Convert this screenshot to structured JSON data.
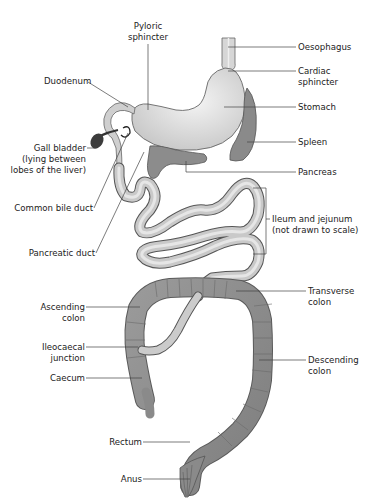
{
  "diagram": {
    "colors": {
      "background": "#ffffff",
      "stomach": "#d9d9d9",
      "stomach_highlight": "#f2f2f2",
      "small_intestine": "#c8c8c8",
      "colon": "#8c8c8c",
      "organ_dark": "#7a7a7a",
      "outline": "#555555",
      "label": "#222222"
    },
    "labels": {
      "pyloric_sphincter": [
        "Pyloric",
        "sphincter"
      ],
      "duodenum": "Duodenum",
      "oesophagus": "Oesophagus",
      "cardiac_sphincter": [
        "Cardiac",
        "sphincter"
      ],
      "stomach": "Stomach",
      "spleen": "Spleen",
      "gall_bladder": [
        "Gall bladder",
        "(lying between",
        "lobes of the liver)"
      ],
      "pancreas": "Pancreas",
      "common_bile_duct": "Common bile duct",
      "pancreatic_duct": "Pancreatic duct",
      "ileum_jejunum": [
        "Ileum and jejunum",
        "(not drawn to scale)"
      ],
      "transverse_colon": [
        "Transverse",
        "colon"
      ],
      "ascending_colon": [
        "Ascending",
        "colon"
      ],
      "ileocaecal_junction": [
        "Ileocaecal",
        "junction"
      ],
      "caecum": "Caecum",
      "descending_colon": [
        "Descending",
        "colon"
      ],
      "rectum": "Rectum",
      "anus": "Anus"
    }
  }
}
